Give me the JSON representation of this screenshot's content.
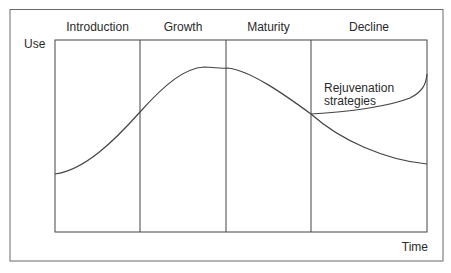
{
  "diagram": {
    "type": "lifecycle-curve",
    "y_axis_label": "Use",
    "x_axis_label": "Time",
    "phases": [
      {
        "label": "Introduction"
      },
      {
        "label": "Growth"
      },
      {
        "label": "Maturity"
      },
      {
        "label": "Decline"
      }
    ],
    "annotation": {
      "line1": "Rejuvenation",
      "line2": "strategies"
    },
    "colors": {
      "line": "#444444",
      "frame": "#666666",
      "text": "#2a2a2a",
      "background": "#ffffff"
    }
  }
}
